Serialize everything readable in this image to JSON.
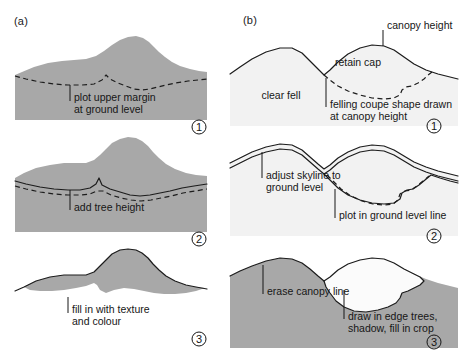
{
  "figure": {
    "title_columns": [
      {
        "id": "a",
        "label": "(a)"
      },
      {
        "id": "b",
        "label": "(b)"
      }
    ],
    "columns": [
      {
        "id": "a",
        "label": "(a)",
        "description": "Plotting a plantation plot on a landscape profile",
        "panels": [
          {
            "step": "1",
            "step_glyph": "①",
            "annotations": [
              "plot upper margin",
              "at ground level"
            ],
            "features": [
              "grey landform mass",
              "dashed ground-level line"
            ]
          },
          {
            "step": "2",
            "step_glyph": "②",
            "annotations": [
              "add tree height"
            ],
            "features": [
              "grey landform mass",
              "solid canopy line raised above dashed ground line",
              "dashed ground-level line"
            ]
          },
          {
            "step": "3",
            "step_glyph": "③",
            "annotations": [
              "fill in with texture",
              "and colour"
            ],
            "features": [
              "grey plot shape filled",
              "white background landform"
            ]
          }
        ]
      },
      {
        "id": "b",
        "label": "(b)",
        "description": "Plotting a felling coupe with retained cap on a landscape profile",
        "panels": [
          {
            "step": "1",
            "step_glyph": "①",
            "annotations": [
              "canopy height",
              "retain cap",
              "clear fell",
              "felling coupe shape drawn",
              "at canopy height"
            ],
            "features": [
              "solid skyline outline",
              "dashed felling coupe boundary",
              "canopy height leader line"
            ]
          },
          {
            "step": "2",
            "step_glyph": "②",
            "annotations": [
              "adjust skyline to",
              "ground level",
              "plot in ground level line"
            ],
            "features": [
              "double skyline with stipple",
              "solid ground-level line",
              "dashed coupe line"
            ]
          },
          {
            "step": "3",
            "step_glyph": "③",
            "annotations": [
              "erase canopy line",
              "draw in edge trees,",
              "shadow, fill in crop"
            ],
            "features": [
              "grey hillside mass",
              "white felling coupe with stippled edge"
            ]
          }
        ]
      }
    ],
    "colors": {
      "grey_fill": "#a8a8a8",
      "light_fill": "#f2f2f2",
      "line": "#1c1c1c",
      "background": "#ffffff"
    }
  }
}
